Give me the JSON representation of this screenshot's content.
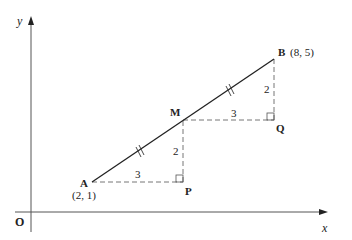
{
  "diagram": {
    "axes": {
      "x_label": "x",
      "y_label": "y",
      "origin_label": "O"
    },
    "points": {
      "A": {
        "name": "A",
        "coords": "(2, 1)"
      },
      "B": {
        "name": "B",
        "coords": "(8, 5)"
      },
      "M": {
        "name": "M"
      },
      "P": {
        "name": "P"
      },
      "Q": {
        "name": "Q"
      }
    },
    "measurements": {
      "AP": "3",
      "PM": "2",
      "MQ": "3",
      "QB": "2"
    },
    "colors": {
      "line": "#222222",
      "axis": "#555555",
      "dashed": "#666666"
    }
  }
}
